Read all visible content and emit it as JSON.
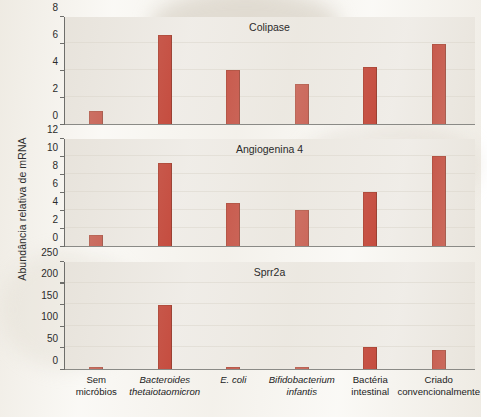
{
  "figure": {
    "y_axis_label": "Abundância relativa de mRNA",
    "bar_color": "#C0392B",
    "plot_background": "#EFECE7"
  },
  "chart_data": [
    {
      "type": "bar",
      "title": "Colipase",
      "categories": [
        "Sem micróbios",
        "Bacteroides thetaiotaomicron",
        "E. coli",
        "Bifidobacterium infantis",
        "Bactéria intestinal",
        "Criado convencionalmente"
      ],
      "values": [
        1.0,
        6.6,
        4.0,
        3.0,
        4.2,
        5.9
      ],
      "xlabel": "",
      "ylabel": "Abundância relativa de mRNA",
      "ylim": [
        0,
        8
      ],
      "yticks": [
        0,
        2,
        4,
        6,
        8
      ],
      "grid": true,
      "legend": false
    },
    {
      "type": "bar",
      "title": "Angiogenina 4",
      "categories": [
        "Sem micróbios",
        "Bacteroides thetaiotaomicron",
        "E. coli",
        "Bifidobacterium infantis",
        "Bactéria intestinal",
        "Criado convencionalmente"
      ],
      "values": [
        1.2,
        9.2,
        4.8,
        4.0,
        6.0,
        10.0
      ],
      "xlabel": "",
      "ylabel": "Abundância relativa de mRNA",
      "ylim": [
        0,
        12
      ],
      "yticks": [
        0,
        2,
        4,
        6,
        8,
        10,
        12
      ],
      "grid": true,
      "legend": false
    },
    {
      "type": "bar",
      "title": "Sprr2a",
      "categories": [
        "Sem micróbios",
        "Bacteroides thetaiotaomicron",
        "E. coli",
        "Bifidobacterium infantis",
        "Bactéria intestinal",
        "Criado convencionalmente"
      ],
      "values": [
        3,
        148,
        4,
        4,
        50,
        45
      ],
      "xlabel": "",
      "ylabel": "Abundância relativa de mRNA",
      "ylim": [
        0,
        250
      ],
      "yticks": [
        0,
        50,
        100,
        150,
        200,
        250
      ],
      "grid": true,
      "legend": false
    }
  ],
  "x_categories": [
    {
      "line1": "Sem",
      "line2": "micróbios",
      "italic": false
    },
    {
      "line1": "Bacteroides",
      "line2": "thetaiotaomicron",
      "italic": true
    },
    {
      "line1": "E. coli",
      "line2": "",
      "italic": true
    },
    {
      "line1": "Bifidobacterium",
      "line2": "infantis",
      "italic": true
    },
    {
      "line1": "Bactéria",
      "line2": "intestinal",
      "italic": false
    },
    {
      "line1": "Criado",
      "line2": "convencionalmente",
      "italic": false
    }
  ]
}
